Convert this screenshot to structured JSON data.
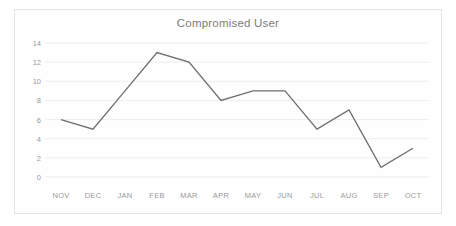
{
  "chart_data": {
    "type": "line",
    "title": "Compromised User",
    "xlabel": "",
    "ylabel": "",
    "categories": [
      "NOV",
      "DEC",
      "JAN",
      "FEB",
      "MAR",
      "APR",
      "MAY",
      "JUN",
      "JUL",
      "AUG",
      "SEP",
      "OCT"
    ],
    "values": [
      6,
      5,
      9,
      13,
      12,
      8,
      9,
      9,
      5,
      7,
      1,
      3
    ],
    "series": [
      {
        "name": "Compromised User",
        "values": [
          6,
          5,
          9,
          13,
          12,
          8,
          9,
          9,
          5,
          7,
          1,
          3
        ]
      }
    ],
    "ylim": [
      0,
      14
    ],
    "ytick_labels": [
      "14",
      "12",
      "10",
      "8",
      "6",
      "4",
      "2",
      "0"
    ],
    "ytick_values": [
      14,
      12,
      10,
      8,
      6,
      4,
      2,
      0
    ],
    "grid": true,
    "grid_axis": "y",
    "legend": false,
    "legend_position": "none",
    "markers": false,
    "colors": {
      "line": "#6e6e6e",
      "grid": "#ededed",
      "text": "#9a9a9a",
      "title": "#7c7c7c",
      "border": "#e3e3e3",
      "background": "#fefefe"
    }
  }
}
